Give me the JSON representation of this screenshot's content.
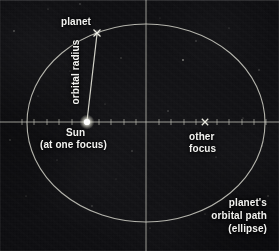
{
  "figure": {
    "background_color": "#0a0a0c",
    "line_color": "#c9c9c2",
    "text_color": "#f2f2f0",
    "width": 279,
    "height": 251
  },
  "labels": {
    "planet": "planet",
    "orbital_radius": "orbital radius",
    "sun": "Sun",
    "sun_focus_note": "(at one focus)",
    "other_focus_line1": "other",
    "other_focus_line2": "focus",
    "orbit_path_line1": "planet's",
    "orbit_path_line2": "orbital path",
    "orbit_path_line3": "(ellipse)"
  },
  "geometry": {
    "ellipse": {
      "center_x": 146,
      "center_y": 123,
      "semi_major_x": 119,
      "semi_minor_y": 99
    },
    "sun_focus": {
      "x": 87,
      "y": 122,
      "marker": "bright-dot"
    },
    "other_focus": {
      "x": 205,
      "y": 122,
      "marker": "x-cross"
    },
    "planet": {
      "x": 97,
      "y": 33,
      "marker": "x-cross"
    },
    "radius_line": {
      "x1": 87,
      "y1": 122,
      "x2": 97,
      "y2": 33
    },
    "major_axis": {
      "x1": 0,
      "y1": 122,
      "x2": 279,
      "y2": 122
    },
    "minor_axis": {
      "x1": 146,
      "y1": 0,
      "x2": 146,
      "y2": 251
    },
    "tick_spacing": 12.4,
    "tick_length": 4
  }
}
